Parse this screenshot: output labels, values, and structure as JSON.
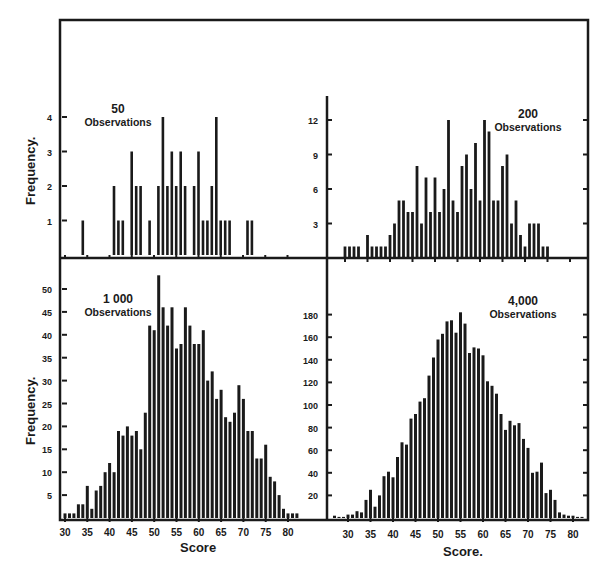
{
  "figure": {
    "ylabel_top": "Frequency.",
    "ylabel_bottom": "Frequency.",
    "xlabel_left": "Score",
    "xlabel_right": "Score.",
    "ink_color": "#1a1a1a",
    "background": "#ffffff"
  },
  "chart_data": [
    {
      "type": "bar",
      "title": "50 Observations",
      "title_number": "50",
      "title_text": "Observations",
      "xlabel": "Score",
      "ylabel": "Frequency.",
      "xlim": [
        30,
        82
      ],
      "ylim": [
        0,
        4.5
      ],
      "yticks": [
        1,
        2,
        3,
        4
      ],
      "grid": false,
      "x": [
        34,
        41,
        42,
        43,
        45,
        46,
        47,
        49,
        51,
        52,
        53,
        54,
        55,
        56,
        57,
        59,
        60,
        61,
        62,
        63,
        64,
        65,
        66,
        67,
        71,
        72
      ],
      "values": [
        1,
        2,
        1,
        1,
        3,
        2,
        2,
        1,
        2,
        4,
        2,
        3,
        2,
        3,
        2,
        2,
        3,
        1,
        1,
        2,
        4,
        1,
        1,
        1,
        1,
        1
      ]
    },
    {
      "type": "bar",
      "title": "200 Observations",
      "title_number": "200",
      "title_text": "Observations",
      "xlabel": "Score",
      "ylabel": "Frequency.",
      "xlim": [
        28,
        82
      ],
      "ylim": [
        0,
        14
      ],
      "yticks": [
        3,
        6,
        9,
        12
      ],
      "grid": false,
      "x": [
        30,
        31,
        32,
        33,
        35,
        36,
        37,
        38,
        39,
        40,
        41,
        42,
        43,
        44,
        45,
        46,
        47,
        48,
        49,
        50,
        51,
        52,
        53,
        54,
        55,
        56,
        57,
        58,
        59,
        60,
        61,
        62,
        63,
        64,
        65,
        66,
        67,
        68,
        69,
        70,
        71,
        72,
        73,
        74,
        75
      ],
      "values": [
        1,
        1,
        1,
        1,
        2,
        1,
        1,
        1,
        1,
        2,
        3,
        5,
        5,
        4,
        4,
        8,
        3,
        7,
        4,
        7,
        4,
        6,
        12,
        5,
        4,
        8,
        9,
        6,
        10,
        5,
        12,
        11,
        5,
        5,
        8,
        9,
        3,
        5,
        2,
        1,
        3,
        3,
        3,
        1,
        1
      ]
    },
    {
      "type": "bar",
      "title": "1 000 Observations",
      "title_number": "1 000",
      "title_text": "Observations",
      "xlabel": "Score",
      "ylabel": "Frequency.",
      "xlim": [
        30,
        83
      ],
      "ylim": [
        0,
        54
      ],
      "xticks": [
        30,
        35,
        40,
        45,
        50,
        55,
        60,
        65,
        70,
        75,
        80
      ],
      "yticks": [
        5,
        10,
        15,
        20,
        25,
        30,
        35,
        40,
        45,
        50
      ],
      "grid": false,
      "x": [
        30,
        31,
        32,
        33,
        34,
        35,
        36,
        37,
        38,
        39,
        40,
        41,
        42,
        43,
        44,
        45,
        46,
        47,
        48,
        49,
        50,
        51,
        52,
        53,
        54,
        55,
        56,
        57,
        58,
        59,
        60,
        61,
        62,
        63,
        64,
        65,
        66,
        67,
        68,
        69,
        70,
        71,
        72,
        73,
        74,
        75,
        76,
        77,
        78,
        79,
        80,
        81,
        82
      ],
      "values": [
        1,
        1,
        1,
        3,
        3,
        7,
        2,
        6,
        7,
        10,
        12,
        10,
        19,
        18,
        20,
        18,
        19,
        15,
        23,
        42,
        41,
        53,
        46,
        42,
        46,
        37,
        38,
        46,
        42,
        38,
        38,
        41,
        30,
        32,
        26,
        28,
        22,
        21,
        23,
        29,
        26,
        19,
        19,
        13,
        13,
        16,
        9,
        8,
        5,
        2,
        1,
        1,
        1
      ]
    },
    {
      "type": "bar",
      "title": "4,000 Observations",
      "title_number": "4,000",
      "title_text": "Observations",
      "xlabel": "Score.",
      "ylabel": "Frequency.",
      "xlim": [
        26,
        83
      ],
      "ylim": [
        0,
        200
      ],
      "xticks": [
        30,
        35,
        40,
        45,
        50,
        55,
        60,
        65,
        70,
        75,
        80
      ],
      "yticks": [
        20,
        40,
        60,
        80,
        100,
        120,
        140,
        160,
        180
      ],
      "grid": false,
      "x": [
        27,
        28,
        29,
        30,
        31,
        32,
        33,
        34,
        35,
        36,
        37,
        38,
        39,
        40,
        41,
        42,
        43,
        44,
        45,
        46,
        47,
        48,
        49,
        50,
        51,
        52,
        53,
        54,
        55,
        56,
        57,
        58,
        59,
        60,
        61,
        62,
        63,
        64,
        65,
        66,
        67,
        68,
        69,
        70,
        71,
        72,
        73,
        74,
        75,
        76,
        77,
        78,
        79,
        80,
        81,
        82
      ],
      "values": [
        2,
        1,
        1,
        3,
        3,
        6,
        5,
        16,
        25,
        10,
        20,
        37,
        41,
        36,
        54,
        67,
        65,
        88,
        92,
        103,
        106,
        126,
        142,
        158,
        163,
        174,
        175,
        164,
        182,
        172,
        146,
        151,
        150,
        144,
        121,
        117,
        110,
        92,
        78,
        86,
        82,
        84,
        70,
        62,
        40,
        41,
        49,
        22,
        25,
        16,
        5,
        3,
        2,
        2,
        1,
        1
      ]
    }
  ]
}
